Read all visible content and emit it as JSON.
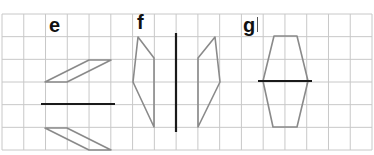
{
  "grid": {
    "x0": 2,
    "y0": 14,
    "x1": 372,
    "y1": 150,
    "cols": 17,
    "rows": 6,
    "line_color": "#c8c8c8"
  },
  "colors": {
    "shape_stroke": "#8a8a8a",
    "mirror_stroke": "#1a1a1a",
    "label": "#111111"
  },
  "problems": [
    {
      "label": "e",
      "mirror": {
        "orientation": "horizontal",
        "x1": 41,
        "y1": 104,
        "x2": 115,
        "y2": 104
      },
      "shapes": [
        {
          "name": "upper-parallelogram",
          "points": [
            [
              45,
              82
            ],
            [
              67,
              82
            ],
            [
              111,
              60
            ],
            [
              89,
              60
            ]
          ]
        },
        {
          "name": "lower-parallelogram-reflection",
          "points": [
            [
              45,
              128
            ],
            [
              67,
              128
            ],
            [
              111,
              150
            ],
            [
              89,
              150
            ]
          ]
        }
      ]
    },
    {
      "label": "f",
      "mirror": {
        "orientation": "vertical",
        "x1": 176,
        "y1": 33,
        "x2": 176,
        "y2": 132
      },
      "shapes": [
        {
          "name": "left-quadrilateral",
          "points": [
            [
              138,
              37
            ],
            [
              154,
              58
            ],
            [
              154,
              127
            ],
            [
              133,
              82
            ]
          ]
        },
        {
          "name": "right-quadrilateral-reflection",
          "points": [
            [
              215,
              37
            ],
            [
              198,
              58
            ],
            [
              198,
              127
            ],
            [
              220,
              82
            ]
          ]
        }
      ]
    },
    {
      "label": "g",
      "mirror": {
        "orientation": "horizontal",
        "x1": 258,
        "y1": 81,
        "x2": 312,
        "y2": 81
      },
      "shapes": [
        {
          "name": "hexagon",
          "points": [
            [
              274,
              36
            ],
            [
              297,
              36
            ],
            [
              308,
              81
            ],
            [
              297,
              127
            ],
            [
              273,
              127
            ],
            [
              263,
              81
            ]
          ]
        }
      ]
    }
  ]
}
